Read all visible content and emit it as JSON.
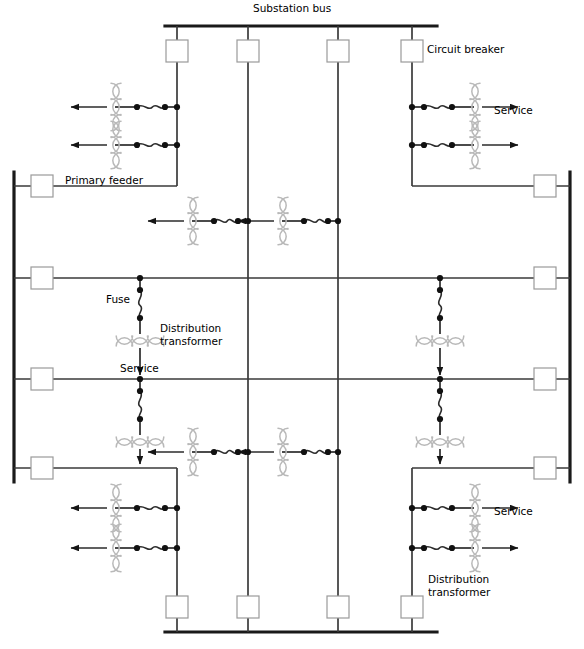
{
  "figure": {
    "kind": "single-line-diagram",
    "line_color": "#2b2b2b",
    "bus_color": "#1a1a1a",
    "coil_color": "#b9b9b9",
    "breaker_fill": "#ffffff",
    "breaker_stroke": "#9a9a9a",
    "background": "#ffffff"
  },
  "labels": {
    "substation_bus": "Substation bus",
    "circuit_breaker": "Circuit breaker",
    "primary_feeder": "Primary feeder",
    "fuse": "Fuse",
    "distribution_transformer_line1": "Distribution",
    "distribution_transformer_line2": "transformer",
    "distribution_transformer_b_line1": "Distribution",
    "distribution_transformer_b_line2": "transformer",
    "service_top_right": "Service",
    "service_center": "Service",
    "service_bottom_right": "Service"
  },
  "buses": [
    {
      "name": "substation-bus-top",
      "x1": 165,
      "y1": 26,
      "x2": 437,
      "y2": 26,
      "orientation": "horizontal"
    },
    {
      "name": "bus-left",
      "x1": 14,
      "y1": 172,
      "x2": 14,
      "y2": 482,
      "orientation": "vertical"
    },
    {
      "name": "bus-right",
      "x1": 570,
      "y1": 172,
      "x2": 570,
      "y2": 482,
      "orientation": "vertical"
    },
    {
      "name": "substation-bus-bottom",
      "x1": 165,
      "y1": 632,
      "x2": 437,
      "y2": 632,
      "orientation": "horizontal"
    }
  ],
  "columns": [
    {
      "name": "column-1",
      "x": 177
    },
    {
      "name": "column-2",
      "x": 248
    },
    {
      "name": "column-3",
      "x": 338
    },
    {
      "name": "column-4",
      "x": 412
    }
  ],
  "rows": [
    {
      "name": "row-1",
      "y": 186,
      "style": "loop"
    },
    {
      "name": "row-2",
      "y": 278,
      "style": "through"
    },
    {
      "name": "row-3",
      "y": 379,
      "style": "through"
    },
    {
      "name": "row-4",
      "y": 468,
      "style": "loop"
    }
  ],
  "breakers": {
    "top": [
      {
        "name": "breaker-top-1",
        "x": 177,
        "y": 51
      },
      {
        "name": "breaker-top-2",
        "x": 248,
        "y": 51
      },
      {
        "name": "breaker-top-3",
        "x": 338,
        "y": 51
      },
      {
        "name": "breaker-top-4",
        "x": 412,
        "y": 51
      }
    ],
    "bottom": [
      {
        "name": "breaker-bottom-1",
        "x": 177,
        "y": 607
      },
      {
        "name": "breaker-bottom-2",
        "x": 248,
        "y": 607
      },
      {
        "name": "breaker-bottom-3",
        "x": 338,
        "y": 607
      },
      {
        "name": "breaker-bottom-4",
        "x": 412,
        "y": 607
      }
    ],
    "left": [
      {
        "name": "breaker-left-1",
        "x": 42,
        "y": 186
      },
      {
        "name": "breaker-left-2",
        "x": 42,
        "y": 278
      },
      {
        "name": "breaker-left-3",
        "x": 42,
        "y": 379
      },
      {
        "name": "breaker-left-4",
        "x": 42,
        "y": 468
      }
    ],
    "right": [
      {
        "name": "breaker-right-1",
        "x": 545,
        "y": 186
      },
      {
        "name": "breaker-right-2",
        "x": 545,
        "y": 278
      },
      {
        "name": "breaker-right-3",
        "x": 545,
        "y": 379
      },
      {
        "name": "breaker-right-4",
        "x": 545,
        "y": 468
      }
    ],
    "size": 22
  },
  "transformer_banks": [
    {
      "name": "bank-top-left",
      "x": 177,
      "direction": "left",
      "taps": [
        107,
        145
      ]
    },
    {
      "name": "bank-top-right",
      "x": 412,
      "direction": "right",
      "taps": [
        107,
        145
      ]
    },
    {
      "name": "bank-bottom-left",
      "x": 177,
      "direction": "left",
      "taps": [
        508,
        548
      ]
    },
    {
      "name": "bank-bottom-right",
      "x": 412,
      "direction": "right",
      "taps": [
        508,
        548
      ]
    }
  ],
  "inline_transformers": [
    {
      "name": "inline-transformer-r2-a",
      "x": 248,
      "y": 221,
      "direction": "left"
    },
    {
      "name": "inline-transformer-r2-b",
      "x": 338,
      "y": 221,
      "direction": "left"
    },
    {
      "name": "inline-transformer-r4-a",
      "x": 248,
      "y": 452,
      "direction": "left"
    },
    {
      "name": "inline-transformer-r4-b",
      "x": 338,
      "y": 452,
      "direction": "left"
    }
  ],
  "vertical_drops": [
    {
      "name": "drop-center-left-upper",
      "x": 140,
      "y_top": 278,
      "y_bottom": 379,
      "labeled": true
    },
    {
      "name": "drop-center-left-lower",
      "x": 140,
      "y_top": 379,
      "y_bottom": 468,
      "labeled": false
    },
    {
      "name": "drop-center-right-upper",
      "x": 440,
      "y_top": 278,
      "y_bottom": 379,
      "labeled": false
    },
    {
      "name": "drop-center-right-lower",
      "x": 440,
      "y_top": 379,
      "y_bottom": 468,
      "labeled": false
    }
  ],
  "legend_text": {
    "fuse_symbol": "fuse-squiggle",
    "transformer_symbol": "transformer-coil-arcs",
    "breaker_symbol": "open-square",
    "service_symbol": "arrow-head"
  }
}
